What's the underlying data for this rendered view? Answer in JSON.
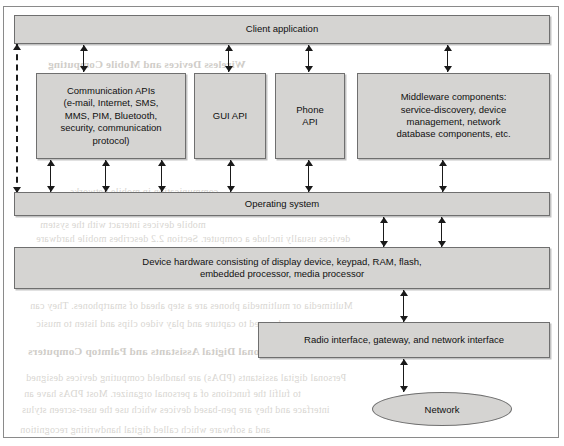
{
  "figure": {
    "background": "#ffffff",
    "box_fill": "#d5d4d2",
    "box_border": "#6f6f6f",
    "arrow_color": "#1a1a1a"
  },
  "nodes": {
    "client_application": "Client application",
    "communication_apis": "Communication APIs\n(e-mail, Internet, SMS,\nMMS, PIM, Bluetooth,\nsecurity, communication\nprotocol)",
    "gui_api": "GUI API",
    "phone_api": "Phone\nAPI",
    "middleware": "Middleware components:\nservice-discovery, device\nmanagement, network\ndatabase components, etc.",
    "operating_system": "Operating system",
    "device_hardware": "Device  hardware consisting of display device, keypad, RAM, flash,\nembedded processor, media processor",
    "radio_interface": "Radio interface, gateway, and network interface",
    "network": "Network"
  },
  "connectors": [
    {
      "name": "client-to-communication-apis",
      "style": "double"
    },
    {
      "name": "client-to-gui-api",
      "style": "double"
    },
    {
      "name": "client-to-phone-api",
      "style": "double"
    },
    {
      "name": "client-to-middleware",
      "style": "double"
    },
    {
      "name": "client-to-operating-system-dashed",
      "style": "dashed-double"
    },
    {
      "name": "communication-apis-to-operating-system",
      "style": "double"
    },
    {
      "name": "gui-api-to-operating-system",
      "style": "double"
    },
    {
      "name": "phone-api-to-operating-system",
      "style": "double"
    },
    {
      "name": "middleware-to-operating-system",
      "style": "double"
    },
    {
      "name": "operating-system-to-device-hardware",
      "style": "double"
    },
    {
      "name": "device-hardware-to-radio-interface",
      "style": "double"
    },
    {
      "name": "radio-interface-to-network",
      "style": "double"
    }
  ],
  "bleed_text": {
    "l1": "Wireless Devices and Mobile Computing",
    "l2": "The mobile devices and handheld systems",
    "l3": "computers and mobile phones",
    "l4": "communication in mobile networks",
    "l5": "mobile devices interact with the system",
    "l6": "devices usually include a computer. Section 2.2 describes mobile hardware",
    "l7": "Multimedia or multimedia phones are a step ahead of smartphones. They can",
    "l8": "be used to capture and play video clips and listen to music",
    "l9": "1.4.3  Handheld Personal Digital Assistants and Palmtop Computers",
    "l10": "Personal digital assistants (PDAs) are handheld computing devices designed",
    "l11": "to fulfil the functions of a personal organizer. Most PDAs have an",
    "l12": "interface and they are pen-based devices which use the user-screen stylus",
    "l13": "and a software which called digital handwriting recognition"
  }
}
